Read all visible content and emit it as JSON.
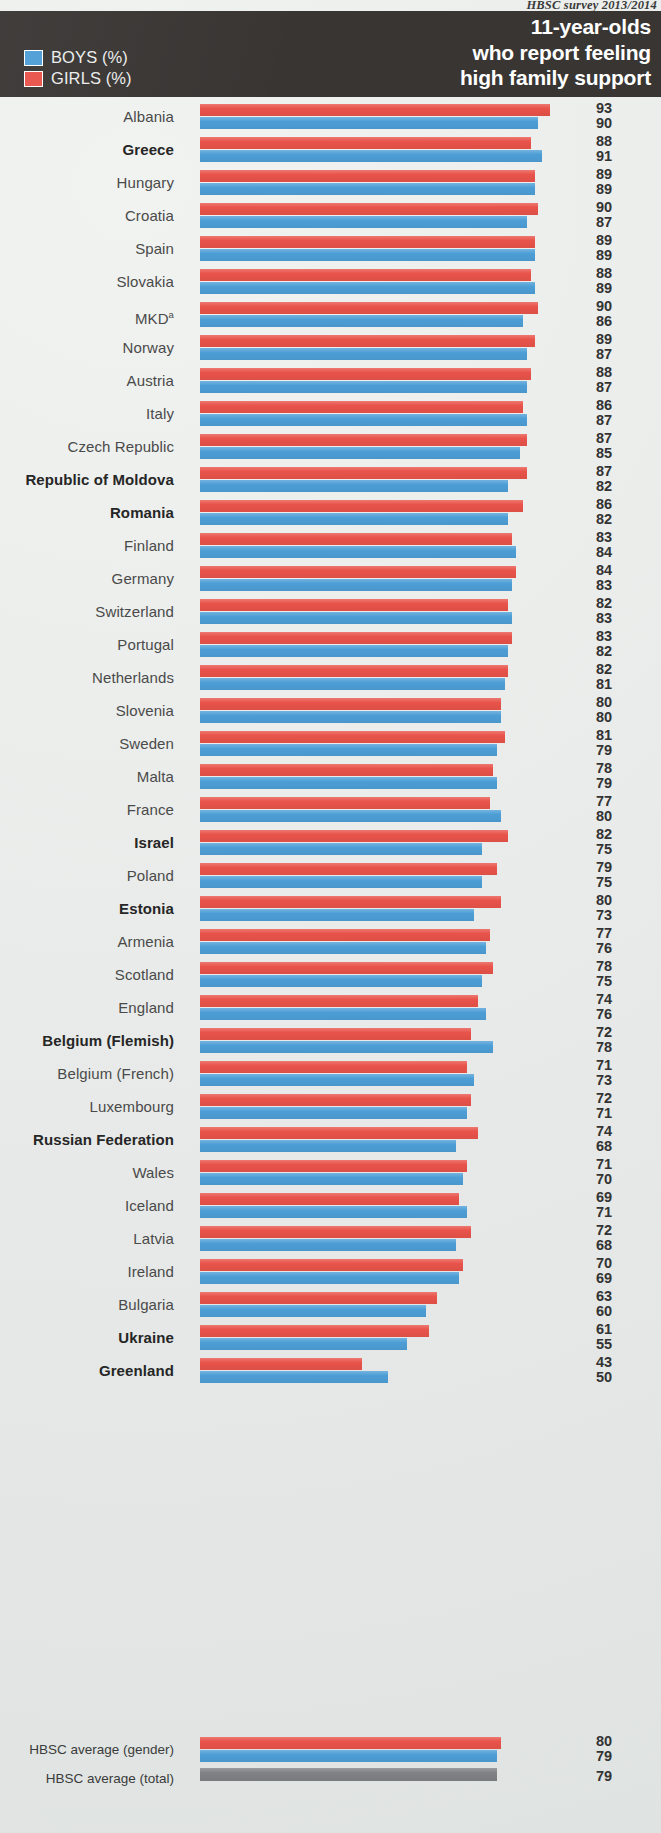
{
  "source_note": "HBSC survey 2013/2014",
  "header": {
    "title_lines": [
      "11-year-olds",
      "who report feeling",
      "high family support"
    ],
    "legend": [
      {
        "key": "boys",
        "label": "BOYS (%)",
        "color": "#4d9ed6"
      },
      {
        "key": "girls",
        "label": "GIRLS (%)",
        "color": "#e8534a"
      }
    ]
  },
  "footer": {
    "gender_label": "HBSC average (gender)",
    "total_label": "HBSC average (total)",
    "gender_girls": 80,
    "gender_boys": 79,
    "total": 79,
    "total_color": "#808184"
  },
  "chart_data": {
    "type": "bar",
    "orientation": "horizontal",
    "title": "11-year-olds who report feeling high family support",
    "subtitle": "HBSC survey 2013/2014",
    "xlabel": "%",
    "ylabel": "",
    "xlim": [
      0,
      100
    ],
    "grid": false,
    "legend_position": "top-left",
    "series": [
      {
        "name": "GIRLS (%)",
        "color": "#e8534a"
      },
      {
        "name": "BOYS (%)",
        "color": "#4d9ed6"
      }
    ],
    "categories": [
      "Albania",
      "Greece",
      "Hungary",
      "Croatia",
      "Spain",
      "Slovakia",
      "MKD",
      "Norway",
      "Austria",
      "Italy",
      "Czech Republic",
      "Republic of Moldova",
      "Romania",
      "Finland",
      "Germany",
      "Switzerland",
      "Portugal",
      "Netherlands",
      "Slovenia",
      "Sweden",
      "Malta",
      "France",
      "Israel",
      "Poland",
      "Estonia",
      "Armenia",
      "Scotland",
      "England",
      "Belgium (Flemish)",
      "Belgium (French)",
      "Luxembourg",
      "Russian Federation",
      "Wales",
      "Iceland",
      "Latvia",
      "Ireland",
      "Bulgaria",
      "Ukraine",
      "Greenland"
    ],
    "girls": [
      93,
      88,
      89,
      90,
      89,
      88,
      90,
      89,
      88,
      86,
      87,
      87,
      86,
      83,
      84,
      82,
      83,
      82,
      80,
      81,
      78,
      77,
      82,
      79,
      80,
      77,
      78,
      74,
      72,
      71,
      72,
      74,
      71,
      69,
      72,
      70,
      63,
      61,
      43
    ],
    "boys": [
      90,
      91,
      89,
      87,
      89,
      89,
      86,
      87,
      87,
      87,
      85,
      82,
      82,
      84,
      83,
      83,
      82,
      81,
      80,
      79,
      79,
      80,
      75,
      75,
      73,
      76,
      75,
      76,
      78,
      73,
      71,
      68,
      70,
      71,
      68,
      69,
      60,
      55,
      50
    ],
    "average_gender": {
      "girls": 80,
      "boys": 79
    },
    "average_total": 79
  },
  "rows": [
    {
      "label": "Albania",
      "bold": false,
      "girls": 93,
      "boys": 90
    },
    {
      "label": "Greece",
      "bold": true,
      "girls": 88,
      "boys": 91
    },
    {
      "label": "Hungary",
      "bold": false,
      "girls": 89,
      "boys": 89
    },
    {
      "label": "Croatia",
      "bold": false,
      "girls": 90,
      "boys": 87
    },
    {
      "label": "Spain",
      "bold": false,
      "girls": 89,
      "boys": 89
    },
    {
      "label": "Slovakia",
      "bold": false,
      "girls": 88,
      "boys": 89
    },
    {
      "label": "MKD",
      "bold": false,
      "girls": 90,
      "boys": 86,
      "superscript": "a"
    },
    {
      "label": "Norway",
      "bold": false,
      "girls": 89,
      "boys": 87
    },
    {
      "label": "Austria",
      "bold": false,
      "girls": 88,
      "boys": 87
    },
    {
      "label": "Italy",
      "bold": false,
      "girls": 86,
      "boys": 87
    },
    {
      "label": "Czech Republic",
      "bold": false,
      "girls": 87,
      "boys": 85
    },
    {
      "label": "Republic of Moldova",
      "bold": true,
      "girls": 87,
      "boys": 82
    },
    {
      "label": "Romania",
      "bold": true,
      "girls": 86,
      "boys": 82
    },
    {
      "label": "Finland",
      "bold": false,
      "girls": 83,
      "boys": 84
    },
    {
      "label": "Germany",
      "bold": false,
      "girls": 84,
      "boys": 83
    },
    {
      "label": "Switzerland",
      "bold": false,
      "girls": 82,
      "boys": 83
    },
    {
      "label": "Portugal",
      "bold": false,
      "girls": 83,
      "boys": 82
    },
    {
      "label": "Netherlands",
      "bold": false,
      "girls": 82,
      "boys": 81
    },
    {
      "label": "Slovenia",
      "bold": false,
      "girls": 80,
      "boys": 80
    },
    {
      "label": "Sweden",
      "bold": false,
      "girls": 81,
      "boys": 79
    },
    {
      "label": "Malta",
      "bold": false,
      "girls": 78,
      "boys": 79
    },
    {
      "label": "France",
      "bold": false,
      "girls": 77,
      "boys": 80
    },
    {
      "label": "Israel",
      "bold": true,
      "girls": 82,
      "boys": 75
    },
    {
      "label": "Poland",
      "bold": false,
      "girls": 79,
      "boys": 75
    },
    {
      "label": "Estonia",
      "bold": true,
      "girls": 80,
      "boys": 73
    },
    {
      "label": "Armenia",
      "bold": false,
      "girls": 77,
      "boys": 76
    },
    {
      "label": "Scotland",
      "bold": false,
      "girls": 78,
      "boys": 75
    },
    {
      "label": "England",
      "bold": false,
      "girls": 74,
      "boys": 76
    },
    {
      "label": "Belgium (Flemish)",
      "bold": true,
      "girls": 72,
      "boys": 78
    },
    {
      "label": "Belgium (French)",
      "bold": false,
      "girls": 71,
      "boys": 73
    },
    {
      "label": "Luxembourg",
      "bold": false,
      "girls": 72,
      "boys": 71
    },
    {
      "label": "Russian Federation",
      "bold": true,
      "girls": 74,
      "boys": 68
    },
    {
      "label": "Wales",
      "bold": false,
      "girls": 71,
      "boys": 70
    },
    {
      "label": "Iceland",
      "bold": false,
      "girls": 69,
      "boys": 71
    },
    {
      "label": "Latvia",
      "bold": false,
      "girls": 72,
      "boys": 68
    },
    {
      "label": "Ireland",
      "bold": false,
      "girls": 70,
      "boys": 69
    },
    {
      "label": "Bulgaria",
      "bold": false,
      "girls": 63,
      "boys": 60
    },
    {
      "label": "Ukraine",
      "bold": true,
      "girls": 61,
      "boys": 55
    },
    {
      "label": "Greenland",
      "bold": true,
      "girls": 43,
      "boys": 50
    }
  ]
}
